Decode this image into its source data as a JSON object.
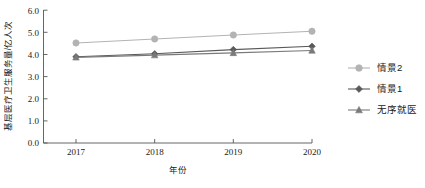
{
  "chart_data": {
    "type": "line",
    "title": "",
    "xlabel": "年份",
    "ylabel": "基层医疗卫生服务量/亿人次",
    "categories": [
      "2017",
      "2018",
      "2019",
      "2020"
    ],
    "x": [
      2017,
      2018,
      2019,
      2020
    ],
    "xlim": [
      2016.6,
      2020.35
    ],
    "ylim": [
      0.0,
      6.0
    ],
    "yticks": [
      "0.0",
      "1.0",
      "2.0",
      "3.0",
      "4.0",
      "5.0",
      "6.0"
    ],
    "ytick_values": [
      0.0,
      1.0,
      2.0,
      3.0,
      4.0,
      5.0,
      6.0
    ],
    "grid": false,
    "legend_position": "right",
    "series": [
      {
        "name": "情景2",
        "values": [
          4.52,
          4.7,
          4.88,
          5.05
        ],
        "color": "#b3b3b3",
        "marker": "circle"
      },
      {
        "name": "情景1",
        "values": [
          3.9,
          4.03,
          4.22,
          4.37
        ],
        "color": "#595959",
        "marker": "diamond"
      },
      {
        "name": "无序就医",
        "values": [
          3.87,
          3.97,
          4.07,
          4.18
        ],
        "color": "#7a7a7a",
        "marker": "triangle"
      }
    ]
  },
  "legend": {
    "items": [
      {
        "label": "情景2"
      },
      {
        "label": "情景1"
      },
      {
        "label": "无序就医"
      }
    ]
  }
}
